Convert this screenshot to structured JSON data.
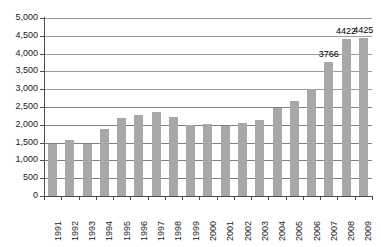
{
  "chart_data": {
    "type": "bar",
    "title": "",
    "subtitle": "",
    "xlabel": "",
    "ylabel": "",
    "ylim": [
      0,
      5000
    ],
    "ytick_step": 500,
    "grid": true,
    "legend": false,
    "bar_color": "#a8a8a8",
    "categories": [
      "1991",
      "1992",
      "1993",
      "1994",
      "1995",
      "1996",
      "1997",
      "1998",
      "1999",
      "2000",
      "2001",
      "2002",
      "2003",
      "2004",
      "2005",
      "2006",
      "2007",
      "2008",
      "2009"
    ],
    "values": [
      1470,
      1570,
      1470,
      1880,
      2180,
      2270,
      2370,
      2220,
      1990,
      2010,
      1980,
      2040,
      2130,
      2460,
      2660,
      3000,
      3766,
      4422,
      4425
    ],
    "ytick_labels": [
      "5,000",
      "4,500",
      "4,000",
      "3,500",
      "3,000",
      "2,500",
      "2,000",
      "1,500",
      "1,000",
      "500",
      "0"
    ],
    "ytick_values": [
      5000,
      4500,
      4000,
      3500,
      3000,
      2500,
      2000,
      1500,
      1000,
      500,
      0
    ],
    "annotations": [
      {
        "category": "2007",
        "text": "3766",
        "value": 3766
      },
      {
        "category": "2008",
        "text": "4422",
        "value": 4422
      },
      {
        "category": "2009",
        "text": "4425",
        "value": 4425
      }
    ]
  }
}
